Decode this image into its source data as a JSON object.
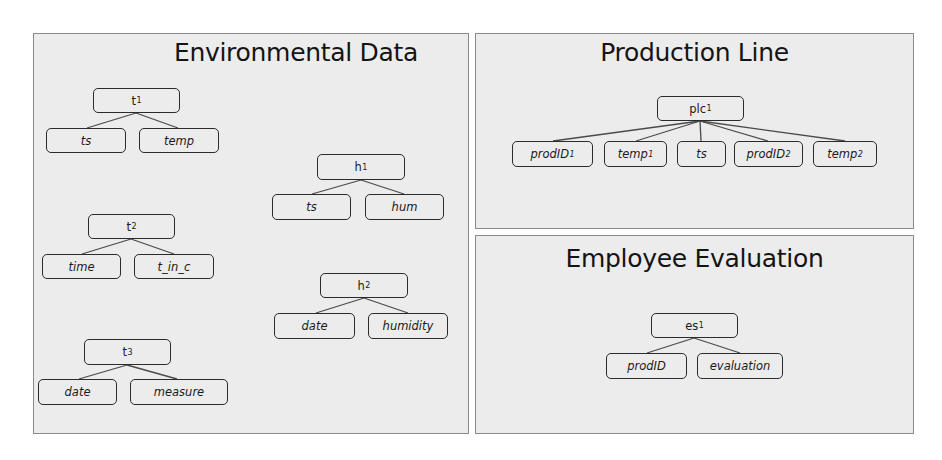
{
  "panels": {
    "environmental": {
      "title": "Environmental Data",
      "trees": [
        {
          "root": {
            "base": "t",
            "sub": "1"
          },
          "children": [
            {
              "base": "ts",
              "sub": ""
            },
            {
              "base": "temp",
              "sub": ""
            }
          ]
        },
        {
          "root": {
            "base": "t",
            "sub": "2"
          },
          "children": [
            {
              "base": "time",
              "sub": ""
            },
            {
              "base": "t_in_c",
              "sub": ""
            }
          ]
        },
        {
          "root": {
            "base": "t",
            "sub": "3"
          },
          "children": [
            {
              "base": "date",
              "sub": ""
            },
            {
              "base": "measure",
              "sub": ""
            }
          ]
        },
        {
          "root": {
            "base": "h",
            "sub": "1"
          },
          "children": [
            {
              "base": "ts",
              "sub": ""
            },
            {
              "base": "hum",
              "sub": ""
            }
          ]
        },
        {
          "root": {
            "base": "h",
            "sub": "2"
          },
          "children": [
            {
              "base": "date",
              "sub": ""
            },
            {
              "base": "humidity",
              "sub": ""
            }
          ]
        }
      ]
    },
    "production": {
      "title": "Production Line",
      "trees": [
        {
          "root": {
            "base": "plc",
            "sub": "1"
          },
          "children": [
            {
              "base": "prodID",
              "sub": "1"
            },
            {
              "base": "temp",
              "sub": "1"
            },
            {
              "base": "ts",
              "sub": ""
            },
            {
              "base": "prodID",
              "sub": "2"
            },
            {
              "base": "temp",
              "sub": "2"
            }
          ]
        }
      ]
    },
    "employee": {
      "title": "Employee Evaluation",
      "trees": [
        {
          "root": {
            "base": "es",
            "sub": "1"
          },
          "children": [
            {
              "base": "prodID",
              "sub": ""
            },
            {
              "base": "evaluation",
              "sub": ""
            }
          ]
        }
      ]
    }
  },
  "colors": {
    "panel_bg": "#ececec",
    "panel_border": "#8a8a8a",
    "node_border": "#2b2b2b",
    "edge": "#4a4a4a",
    "text": "#141414"
  }
}
